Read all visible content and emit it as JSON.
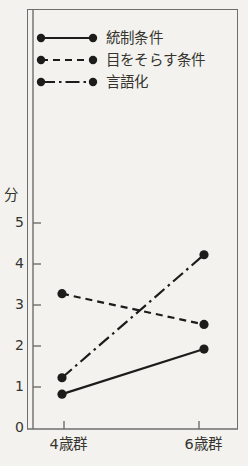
{
  "chart_data": {
    "type": "line",
    "title": "",
    "xlabel": "",
    "ylabel": "分",
    "categories": [
      "4歳群",
      "6歳群"
    ],
    "x_tick_labels": [
      "4歳群",
      "6歳群"
    ],
    "y_tick_labels": [
      "0",
      "1",
      "2",
      "3",
      "4",
      "5"
    ],
    "ylim": [
      0,
      5.6
    ],
    "grid": false,
    "legend_position": "top-inside",
    "series": [
      {
        "name": "統制条件",
        "style": "solid",
        "marker": "filled-circle",
        "values": [
          0.85,
          1.95
        ]
      },
      {
        "name": "目をそらす条件",
        "style": "dashed",
        "marker": "filled-circle",
        "values": [
          3.3,
          2.55
        ]
      },
      {
        "name": "言語化",
        "style": "dash-dot",
        "marker": "filled-circle",
        "values": [
          1.25,
          4.25
        ]
      }
    ],
    "line_color": "#1c1c1a",
    "axis_color": "#6e6e6c",
    "background_color": "#f3f2ee"
  },
  "legend": {
    "items": [
      {
        "label": "統制条件",
        "style": "solid"
      },
      {
        "label": "目をそらす条件",
        "style": "dashed"
      },
      {
        "label": "言語化",
        "style": "dash-dot"
      }
    ]
  },
  "axes": {
    "y_unit": "分",
    "y_ticks": [
      "5",
      "4",
      "3",
      "2",
      "1",
      "0"
    ],
    "x_ticks": [
      "4歳群",
      "6歳群"
    ]
  }
}
